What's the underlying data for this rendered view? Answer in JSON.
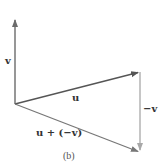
{
  "figure": {
    "caption": "(b)",
    "vectors": [
      {
        "id": "v",
        "label": "v",
        "from": [
          15,
          104
        ],
        "to": [
          15,
          18
        ],
        "color": "#6b6b6b"
      },
      {
        "id": "u",
        "label": "u",
        "from": [
          15,
          104
        ],
        "to": [
          140,
          72
        ],
        "color": "#555555"
      },
      {
        "id": "neg_v",
        "label": "−v",
        "from": [
          140,
          72
        ],
        "to": [
          140,
          152
        ],
        "color": "#a8a8a8"
      },
      {
        "id": "u_plus_neg_v",
        "label": "u + (−v)",
        "from": [
          15,
          104
        ],
        "to": [
          140,
          152
        ],
        "color": "#777777"
      }
    ]
  },
  "labels": {
    "v": "v",
    "u": "u",
    "neg_v": "−v",
    "sum": "u + (−v)",
    "caption": "(b)"
  }
}
